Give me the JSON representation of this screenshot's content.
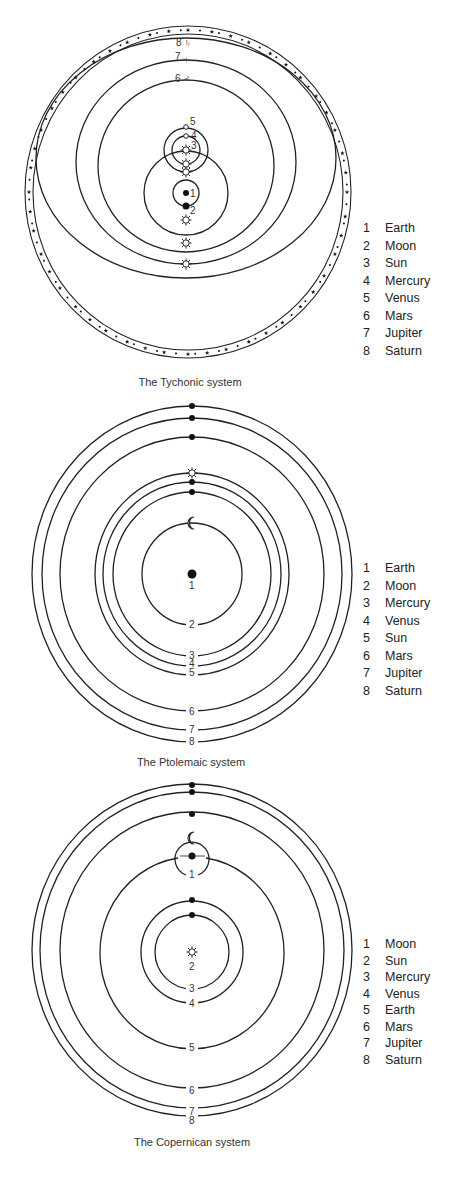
{
  "figures": [
    {
      "id": "tychonic",
      "caption": "The Tychonic system",
      "legend": [
        {
          "num": "1",
          "name": "Earth"
        },
        {
          "num": "2",
          "name": "Moon"
        },
        {
          "num": "3",
          "name": "Sun"
        },
        {
          "num": "4",
          "name": "Mercury"
        },
        {
          "num": "5",
          "name": "Venus"
        },
        {
          "num": "6",
          "name": "Mars"
        },
        {
          "num": "7",
          "name": "Jupiter"
        },
        {
          "num": "8",
          "name": "Saturn"
        }
      ],
      "labels": {
        "earth": "1",
        "moon": "2",
        "sun": "3",
        "mercury": "4",
        "venus": "5",
        "mars": "6",
        "jupiter": "7",
        "saturn": "8"
      },
      "symbols": {
        "saturn": "♄",
        "jupiter": "♃",
        "mars": "♂"
      }
    },
    {
      "id": "ptolemaic",
      "caption": "The Ptolemaic system",
      "legend": [
        {
          "num": "1",
          "name": "Earth"
        },
        {
          "num": "2",
          "name": "Moon"
        },
        {
          "num": "3",
          "name": "Mercury"
        },
        {
          "num": "4",
          "name": "Venus"
        },
        {
          "num": "5",
          "name": "Sun"
        },
        {
          "num": "6",
          "name": "Mars"
        },
        {
          "num": "7",
          "name": "Jupiter"
        },
        {
          "num": "8",
          "name": "Saturn"
        }
      ],
      "labels": {
        "earth": "1",
        "moon": "2",
        "mercury": "3",
        "venus": "4",
        "sun": "5",
        "mars": "6",
        "jupiter": "7",
        "saturn": "8"
      }
    },
    {
      "id": "copernican",
      "caption": "The Copernican system",
      "legend": [
        {
          "num": "1",
          "name": "Moon"
        },
        {
          "num": "2",
          "name": "Sun"
        },
        {
          "num": "3",
          "name": "Mercury"
        },
        {
          "num": "4",
          "name": "Venus"
        },
        {
          "num": "5",
          "name": "Earth"
        },
        {
          "num": "6",
          "name": "Mars"
        },
        {
          "num": "7",
          "name": "Jupiter"
        },
        {
          "num": "8",
          "name": "Saturn"
        }
      ],
      "labels": {
        "moon": "1",
        "sun": "2",
        "mercury": "3",
        "venus": "4",
        "earth": "5",
        "mars": "6",
        "jupiter": "7",
        "saturn": "8"
      }
    }
  ]
}
